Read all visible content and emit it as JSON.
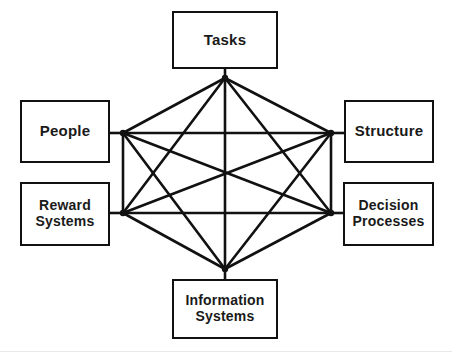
{
  "diagram": {
    "type": "network",
    "background_color": "#ffffff",
    "line_color": "#111111",
    "box_border_color": "#111111",
    "box_fill_color": "#ffffff",
    "text_color": "#1a1a1a",
    "nodes": [
      {
        "id": "tasks",
        "label": "Tasks",
        "position": "top",
        "box": {
          "x": 172,
          "y": 11,
          "w": 106,
          "h": 58
        },
        "hub": {
          "x": 225,
          "y": 78
        }
      },
      {
        "id": "people",
        "label": "People",
        "position": "left-upper",
        "box": {
          "x": 20,
          "y": 100,
          "w": 90,
          "h": 63
        },
        "hub": {
          "x": 123,
          "y": 133
        }
      },
      {
        "id": "structure",
        "label": "Structure",
        "position": "right-upper",
        "box": {
          "x": 344,
          "y": 100,
          "w": 90,
          "h": 63
        },
        "hub": {
          "x": 331,
          "y": 133
        }
      },
      {
        "id": "reward-systems",
        "label": "Reward\nSystems",
        "position": "left-lower",
        "box": {
          "x": 20,
          "y": 182,
          "w": 90,
          "h": 64
        },
        "hub": {
          "x": 123,
          "y": 213
        }
      },
      {
        "id": "decision-processes",
        "label": "Decision\nProcesses",
        "position": "right-lower",
        "box": {
          "x": 343,
          "y": 182,
          "w": 91,
          "h": 64
        },
        "hub": {
          "x": 331,
          "y": 213
        }
      },
      {
        "id": "information-systems",
        "label": "Information\nSystems",
        "position": "bottom",
        "box": {
          "x": 172,
          "y": 279,
          "w": 106,
          "h": 60
        },
        "hub": {
          "x": 225,
          "y": 269
        }
      }
    ],
    "stems": [
      {
        "from_box": "tasks",
        "x1": 225,
        "y1": 69,
        "x2": 225,
        "y2": 78
      },
      {
        "from_box": "people",
        "x1": 110,
        "y1": 133,
        "x2": 123,
        "y2": 133
      },
      {
        "from_box": "structure",
        "x1": 344,
        "y1": 133,
        "x2": 331,
        "y2": 133
      },
      {
        "from_box": "reward-systems",
        "x1": 110,
        "y1": 213,
        "x2": 123,
        "y2": 213
      },
      {
        "from_box": "decision-processes",
        "x1": 343,
        "y1": 213,
        "x2": 331,
        "y2": 213
      },
      {
        "from_box": "information-systems",
        "x1": 225,
        "y1": 279,
        "x2": 225,
        "y2": 269
      }
    ],
    "edges": [
      {
        "from": "tasks",
        "to": "people",
        "x1": 225,
        "y1": 78,
        "x2": 123,
        "y2": 133
      },
      {
        "from": "tasks",
        "to": "structure",
        "x1": 225,
        "y1": 78,
        "x2": 331,
        "y2": 133
      },
      {
        "from": "tasks",
        "to": "reward-systems",
        "x1": 225,
        "y1": 78,
        "x2": 123,
        "y2": 213
      },
      {
        "from": "tasks",
        "to": "decision-processes",
        "x1": 225,
        "y1": 78,
        "x2": 331,
        "y2": 213
      },
      {
        "from": "tasks",
        "to": "information-systems",
        "x1": 225,
        "y1": 78,
        "x2": 225,
        "y2": 269
      },
      {
        "from": "people",
        "to": "structure",
        "x1": 123,
        "y1": 133,
        "x2": 331,
        "y2": 133
      },
      {
        "from": "people",
        "to": "reward-systems",
        "x1": 123,
        "y1": 133,
        "x2": 123,
        "y2": 213
      },
      {
        "from": "people",
        "to": "decision-processes",
        "x1": 123,
        "y1": 133,
        "x2": 331,
        "y2": 213
      },
      {
        "from": "people",
        "to": "information-systems",
        "x1": 123,
        "y1": 133,
        "x2": 225,
        "y2": 269
      },
      {
        "from": "structure",
        "to": "reward-systems",
        "x1": 331,
        "y1": 133,
        "x2": 123,
        "y2": 213
      },
      {
        "from": "structure",
        "to": "decision-processes",
        "x1": 331,
        "y1": 133,
        "x2": 331,
        "y2": 213
      },
      {
        "from": "structure",
        "to": "information-systems",
        "x1": 331,
        "y1": 133,
        "x2": 225,
        "y2": 269
      },
      {
        "from": "reward-systems",
        "to": "decision-processes",
        "x1": 123,
        "y1": 213,
        "x2": 331,
        "y2": 213
      },
      {
        "from": "reward-systems",
        "to": "information-systems",
        "x1": 123,
        "y1": 213,
        "x2": 225,
        "y2": 269
      },
      {
        "from": "decision-processes",
        "to": "information-systems",
        "x1": 331,
        "y1": 213,
        "x2": 225,
        "y2": 269
      }
    ]
  }
}
